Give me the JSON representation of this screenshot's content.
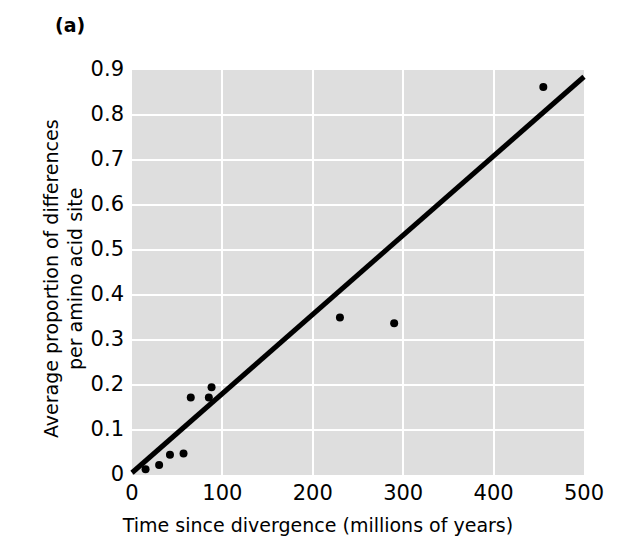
{
  "figure": {
    "panel_label": "(a)",
    "background_color": "#ffffff",
    "plot_background_color": "#dedede",
    "gridline_color": "#ffffff",
    "marker_color": "#000000",
    "line_color": "#000000"
  },
  "chart_data": {
    "type": "scatter",
    "title": "",
    "subtitle": "",
    "xlabel": "Time since divergence (millions of years)",
    "ylabel_line1": "Average proportion of differences",
    "ylabel_line2": "per amino acid site",
    "ylabel": "Average proportion of differences per amino acid site",
    "xlim": [
      0,
      500
    ],
    "ylim": [
      0,
      0.9
    ],
    "xticks": [
      0,
      100,
      200,
      300,
      400,
      500
    ],
    "xtick_labels": [
      "0",
      "100",
      "200",
      "300",
      "400",
      "500"
    ],
    "yticks": [
      0,
      0.1,
      0.2,
      0.3,
      0.4,
      0.5,
      0.6,
      0.7,
      0.8,
      0.9
    ],
    "ytick_labels": [
      "0",
      "0.1",
      "0.2",
      "0.3",
      "0.4",
      "0.5",
      "0.6",
      "0.7",
      "0.8",
      "0.9"
    ],
    "grid": true,
    "grid_orientation": "both",
    "legend": false,
    "legend_position": "none",
    "points": [
      {
        "x": 15,
        "y": 0.013
      },
      {
        "x": 30,
        "y": 0.022
      },
      {
        "x": 42,
        "y": 0.045
      },
      {
        "x": 57,
        "y": 0.048
      },
      {
        "x": 65,
        "y": 0.172
      },
      {
        "x": 85,
        "y": 0.172
      },
      {
        "x": 88,
        "y": 0.195
      },
      {
        "x": 230,
        "y": 0.35
      },
      {
        "x": 290,
        "y": 0.337
      },
      {
        "x": 455,
        "y": 0.862
      }
    ],
    "x": [
      15,
      30,
      42,
      57,
      65,
      85,
      88,
      230,
      290,
      455
    ],
    "values": [
      0.013,
      0.022,
      0.045,
      0.048,
      0.172,
      0.172,
      0.195,
      0.35,
      0.337,
      0.862
    ],
    "trendline": {
      "type": "linear",
      "x_start": 0,
      "y_start": 0.005,
      "x_end": 500,
      "y_end": 0.885,
      "slope": 0.00176,
      "intercept": 0.005
    }
  }
}
